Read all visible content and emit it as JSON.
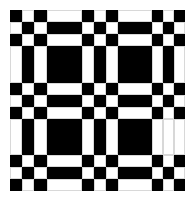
{
  "pattern": {
    "description": "black and white woven plaid grid pattern",
    "colors": {
      "black": "#000000",
      "white": "#ffffff"
    },
    "col_edges": [
      10,
      22,
      34,
      47,
      82,
      94,
      106,
      118,
      152,
      163,
      174,
      185
    ],
    "row_edges": [
      10,
      22,
      34,
      46,
      83,
      95,
      107,
      119,
      155,
      167,
      179,
      191
    ],
    "rows": [
      "BWBWBWBWBWB",
      "WBWBWBWBWBW",
      "BWBWBWBWBWB",
      "WBWBWBWBWBW",
      "BWBWBWBWBWB",
      "WBWBWBWBWBW",
      "BWBWBWBWBWB",
      "WBWBWBWBWWW",
      "BWBWBWBWBWB",
      "WBWBWBWBWBW",
      "BWBWBWBWBWB"
    ]
  }
}
